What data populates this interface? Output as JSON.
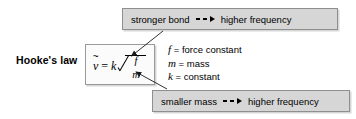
{
  "figure": {
    "label": "Hooke's law",
    "background_color": "#ffffff"
  },
  "equation": {
    "variable": "v",
    "accent": "~",
    "equals": "=",
    "coefficient": "k",
    "radicand_numerator": "f",
    "radicand_denominator": "m",
    "plain_text": "ṽ = k √(f/m)"
  },
  "legend": {
    "items": [
      {
        "symbol": "f",
        "equals": "=",
        "definition": "force constant"
      },
      {
        "symbol": "m",
        "equals": "=",
        "definition": "mass"
      },
      {
        "symbol": "k",
        "equals": "=",
        "definition": "constant"
      }
    ]
  },
  "callouts": {
    "top": {
      "cause": "stronger bond",
      "connector": "--→",
      "effect": "higher frequency",
      "points_to": "f",
      "fill_color": "#d6d6d6",
      "border_color": "#8f8f8f"
    },
    "bottom": {
      "cause": "smaller mass",
      "connector": "--→",
      "effect": "higher frequency",
      "points_to": "m",
      "fill_color": "#d6d6d6",
      "border_color": "#8f8f8f"
    }
  }
}
